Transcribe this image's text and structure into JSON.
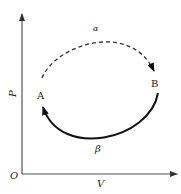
{
  "diagram": {
    "type": "p-v thermodynamic process diagram",
    "axes": {
      "origin_label": "O",
      "x_label": "V",
      "y_label": "P"
    },
    "states": [
      {
        "id": "A",
        "label": "A"
      },
      {
        "id": "B",
        "label": "B"
      }
    ],
    "processes": [
      {
        "id": "alpha",
        "label": "α",
        "from": "A",
        "to": "B",
        "style": "dashed",
        "path": "upper arc"
      },
      {
        "id": "beta",
        "label": "β",
        "from": "B",
        "to": "A",
        "style": "solid",
        "path": "lower arc"
      }
    ],
    "colors": {
      "axis": "#555555",
      "curve": "#1a1a1a",
      "background": "#ffffff"
    }
  }
}
